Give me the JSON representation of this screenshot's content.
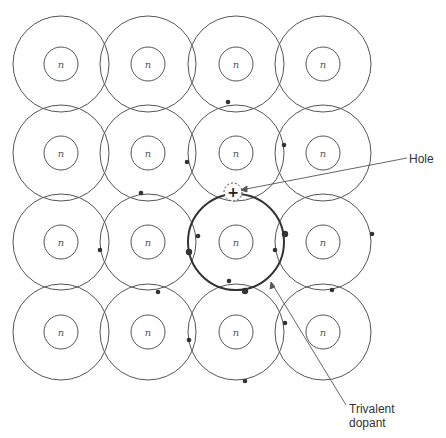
{
  "diagram": {
    "title": "",
    "nucleus_label": "n",
    "grid": {
      "columns_x": [
        61,
        148,
        236,
        323
      ],
      "rows_y": [
        64,
        153,
        242,
        332
      ],
      "outer_radius": 48,
      "inner_radius": 17
    },
    "dopant_atom": {
      "row": 2,
      "col": 2,
      "label": "Trivalent dopant"
    },
    "hole": {
      "x": 233,
      "y": 192,
      "symbol": "+",
      "label": "Hole"
    },
    "labels": {
      "hole": "Hole",
      "trivalent_line1": "Trivalent",
      "trivalent_line2": "dopant"
    },
    "electrons": [
      {
        "x": 187,
        "y": 162,
        "r": 2.3
      },
      {
        "x": 141,
        "y": 193,
        "r": 2.3
      },
      {
        "x": 228,
        "y": 102,
        "r": 2.3
      },
      {
        "x": 284,
        "y": 145,
        "r": 2.3
      },
      {
        "x": 198,
        "y": 236,
        "r": 2.3
      },
      {
        "x": 189,
        "y": 252,
        "r": 3.2
      },
      {
        "x": 100,
        "y": 250,
        "r": 2.3
      },
      {
        "x": 275,
        "y": 250,
        "r": 2.3
      },
      {
        "x": 285,
        "y": 234,
        "r": 3.2
      },
      {
        "x": 372,
        "y": 234,
        "r": 2.3
      },
      {
        "x": 229,
        "y": 281,
        "r": 2.3
      },
      {
        "x": 245,
        "y": 291,
        "r": 3.2
      },
      {
        "x": 158,
        "y": 292,
        "r": 2.3
      },
      {
        "x": 332,
        "y": 290,
        "r": 2.3
      },
      {
        "x": 189,
        "y": 340,
        "r": 2.3
      },
      {
        "x": 285,
        "y": 323,
        "r": 2.3
      },
      {
        "x": 245,
        "y": 381,
        "r": 2.3
      }
    ]
  }
}
